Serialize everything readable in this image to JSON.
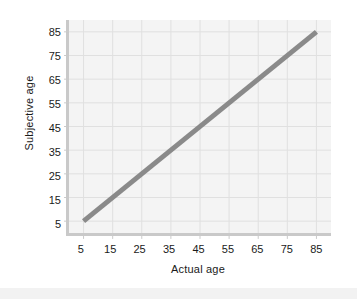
{
  "chart_data": {
    "type": "line",
    "title": "",
    "xlabel": "Actual age",
    "ylabel": "Subjective age",
    "xlim": [
      0,
      90
    ],
    "ylim": [
      0,
      90
    ],
    "xticks": [
      5,
      15,
      25,
      35,
      45,
      55,
      65,
      75,
      85
    ],
    "yticks": [
      5,
      15,
      25,
      35,
      45,
      55,
      65,
      75,
      85
    ],
    "xtick_labels": [
      "5",
      "15",
      "25",
      "35",
      "45",
      "55",
      "65",
      "75",
      "85"
    ],
    "ytick_labels": [
      "5",
      "15",
      "25",
      "35",
      "45",
      "55",
      "65",
      "75",
      "85"
    ],
    "grid": true,
    "legend": false,
    "series": [
      {
        "name": "Identity line",
        "x": [
          5,
          85
        ],
        "values": [
          5,
          85
        ],
        "color": "#8a8a8a",
        "line_width": 5
      }
    ],
    "colors": {
      "line": "#8a8a8a",
      "plot_background": "#f4f4f4",
      "grid": "#dfdfdf",
      "axis": "#c9c9c9",
      "text": "#1a1a1a",
      "figure_background": "#ffffff"
    }
  }
}
